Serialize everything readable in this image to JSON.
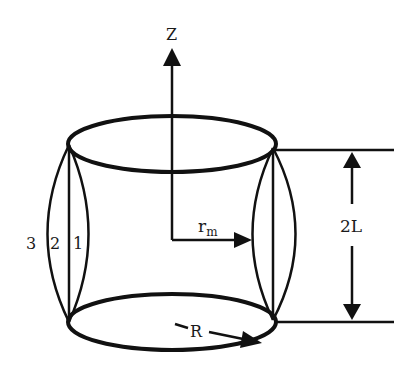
{
  "labels": {
    "z_axis": "Z",
    "radius_mid": "r",
    "radius_mid_sub": "m",
    "radius": "R",
    "height": "2L",
    "curve_1": "1",
    "curve_2": "2",
    "curve_3": "3"
  },
  "colors": {
    "stroke": "#111111",
    "background": "#ffffff"
  }
}
